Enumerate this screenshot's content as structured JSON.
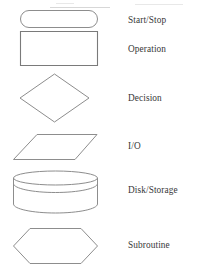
{
  "diagram": {
    "background_color": "#ffffff",
    "stroke_color": "#8d8d8d",
    "label_color": "#373737",
    "rows": [
      {
        "label": "Start/Stop",
        "shape": "rounded-rectangle",
        "shape_name": "terminator-shape"
      },
      {
        "label": "Operation",
        "shape": "rectangle",
        "shape_name": "process-shape"
      },
      {
        "label": "Decision",
        "shape": "diamond",
        "shape_name": "decision-shape"
      },
      {
        "label": "I/O",
        "shape": "parallelogram",
        "shape_name": "input-output-shape"
      },
      {
        "label": "Disk/Storage",
        "shape": "cylinder",
        "shape_name": "disk-storage-shape"
      },
      {
        "label": "Subroutine",
        "shape": "hexagon",
        "shape_name": "subroutine-shape"
      }
    ]
  }
}
